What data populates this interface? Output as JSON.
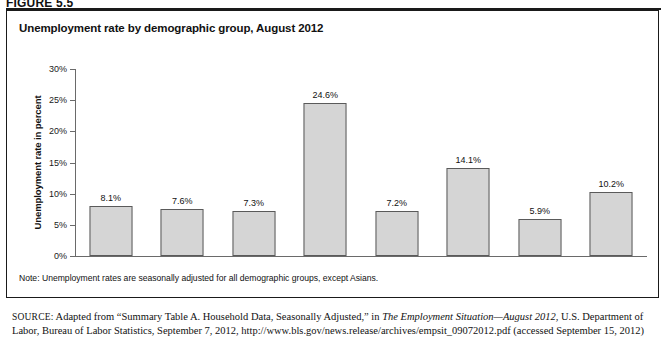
{
  "figure": {
    "number": "FIGURE 5.5"
  },
  "chart_title": "Unemployment rate by demographic group, August 2012",
  "note": "Note: Unemployment rates are seasonally adjusted for all demographic groups, except Asians.",
  "source": {
    "label": "SOURCE:",
    "part1": " Adapted from “Summary Table A. Household Data, Seasonally Adjusted,” in ",
    "italic1": "The Employment Situation—August 2012",
    "part2": ", U.S. Department of Labor, Bureau of Labor Statistics, September 7, 2012, http://www.bls.gov/news.release/archives/empsit_09072012.pdf (accessed September 15, 2012)"
  },
  "colors": {
    "bar_fill": "#d5d5d5",
    "bar_stroke": "#5a5a5a",
    "axis": "#6a6a6a",
    "text": "#111111",
    "frame": "#1a1a1a"
  },
  "chart_data": {
    "type": "bar",
    "title": "Unemployment rate by demographic group, August 2012",
    "xlabel": "",
    "ylabel": "Unemployment rate in percent",
    "ylim": [
      0,
      30
    ],
    "ytick_values": [
      0,
      5,
      10,
      15,
      20,
      25,
      30
    ],
    "ytick_labels": [
      "0%",
      "5%",
      "10%",
      "15%",
      "20%",
      "25%",
      "30%"
    ],
    "grid": false,
    "legend": false,
    "categories": [
      "Total (16 years and over)",
      "Adult men (20 years and over)",
      "Adult women (20 years and over)",
      "Teenagers (16 to 19 years)",
      "White",
      "Black or African American",
      "Asian",
      "Hispanic or Latino ethnicity"
    ],
    "category_lines": [
      [
        "Total",
        "(16 years and over)"
      ],
      [
        "Adult men",
        "(20 years and over)"
      ],
      [
        "Adult women",
        "(20 years and over)"
      ],
      [
        "Teenagers",
        "(16 to 19 years)"
      ],
      [
        "White",
        ""
      ],
      [
        "Black or African",
        "American"
      ],
      [
        "Asian",
        ""
      ],
      [
        "Hispanic or",
        "Latino ethnicity"
      ]
    ],
    "values": [
      8.1,
      7.6,
      7.3,
      24.6,
      7.2,
      14.1,
      5.9,
      10.2
    ],
    "value_labels": [
      "8.1%",
      "7.6%",
      "7.3%",
      "24.6%",
      "7.2%",
      "14.1%",
      "5.9%",
      "10.2%"
    ]
  }
}
